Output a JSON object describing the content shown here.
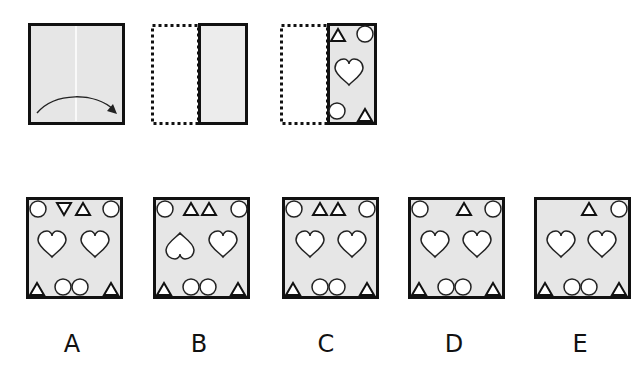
{
  "puzzle": {
    "type": "paper-folding",
    "steps": [
      {
        "id": "step-1",
        "description": "square paper with vertical center crease, arrow folding left half onto right half"
      },
      {
        "id": "step-2",
        "description": "folded paper: dotted outline of left half, solid right half"
      },
      {
        "id": "step-3",
        "description": "folded paper with punched shapes: triangle top-left, circle top-right, heart center, circle bottom-left, triangle bottom-right"
      }
    ],
    "colors": {
      "paper": "#e6e6e6",
      "border": "#111111",
      "shape_fill": "#ffffff"
    }
  },
  "options": [
    {
      "label": "A",
      "top": [
        "circle",
        "triangle-down",
        "triangle",
        "circle"
      ],
      "middle": [
        "heart",
        "heart"
      ],
      "bottom": [
        "triangle",
        "circle",
        "circle",
        "triangle"
      ]
    },
    {
      "label": "B",
      "top": [
        "circle",
        "triangle",
        "triangle",
        "circle"
      ],
      "middle": [
        "heart-inverted",
        "heart"
      ],
      "bottom": [
        "triangle",
        "circle",
        "circle",
        "triangle"
      ]
    },
    {
      "label": "C",
      "top": [
        "circle",
        "triangle",
        "triangle",
        "circle"
      ],
      "middle": [
        "heart",
        "heart"
      ],
      "bottom": [
        "triangle",
        "circle",
        "circle",
        "triangle"
      ]
    },
    {
      "label": "D",
      "top": [
        "circle",
        "triangle",
        "circle"
      ],
      "middle": [
        "heart",
        "heart"
      ],
      "bottom": [
        "triangle",
        "circle",
        "circle",
        "triangle"
      ]
    },
    {
      "label": "E",
      "top": [
        "triangle",
        "circle"
      ],
      "middle": [
        "heart",
        "heart"
      ],
      "bottom": [
        "triangle",
        "circle",
        "circle",
        "triangle"
      ]
    }
  ]
}
